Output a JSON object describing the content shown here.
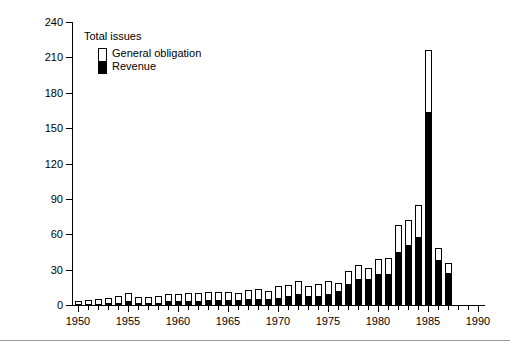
{
  "figure": {
    "ylabel": "Billions of Dollars",
    "legend": {
      "title": "Total issues",
      "items": [
        {
          "label": "General obligation",
          "color": "#ffffff"
        },
        {
          "label": "Revenue",
          "color": "#000000"
        }
      ]
    }
  },
  "chart_data": {
    "type": "bar",
    "subtype": "stacked-vertical",
    "title": "",
    "xlabel": "",
    "ylabel": "Billions of Dollars",
    "xlim": [
      1949.4,
      1990.6
    ],
    "ylim": [
      0,
      240
    ],
    "yticks": [
      0,
      30,
      60,
      90,
      120,
      150,
      180,
      210,
      240
    ],
    "xticks": [
      1950,
      1955,
      1960,
      1965,
      1970,
      1975,
      1980,
      1985,
      1990
    ],
    "xtick_labels": [
      "1950",
      "1955",
      "1960",
      "1965",
      "1970",
      "1975",
      "1980",
      "1985",
      "1990"
    ],
    "minor_xticks": [
      1951,
      1952,
      1953,
      1954,
      1956,
      1957,
      1958,
      1959,
      1961,
      1962,
      1963,
      1964,
      1966,
      1967,
      1968,
      1969,
      1971,
      1972,
      1973,
      1974,
      1976,
      1977,
      1978,
      1979,
      1981,
      1982,
      1983,
      1984,
      1986,
      1987,
      1988,
      1989
    ],
    "grid": false,
    "legend_position": "upper left",
    "x": [
      1950,
      1951,
      1952,
      1953,
      1954,
      1955,
      1956,
      1957,
      1958,
      1959,
      1960,
      1961,
      1962,
      1963,
      1964,
      1965,
      1966,
      1967,
      1968,
      1969,
      1970,
      1971,
      1972,
      1973,
      1974,
      1975,
      1976,
      1977,
      1978,
      1979,
      1980,
      1981,
      1982,
      1983,
      1984,
      1985,
      1986,
      1987
    ],
    "categories": [
      "1950",
      "1951",
      "1952",
      "1953",
      "1954",
      "1955",
      "1956",
      "1957",
      "1958",
      "1959",
      "1960",
      "1961",
      "1962",
      "1963",
      "1964",
      "1965",
      "1966",
      "1967",
      "1968",
      "1969",
      "1970",
      "1971",
      "1972",
      "1973",
      "1974",
      "1975",
      "1976",
      "1977",
      "1978",
      "1979",
      "1980",
      "1981",
      "1982",
      "1983",
      "1984",
      "1985",
      "1986",
      "1987"
    ],
    "series": [
      {
        "name": "Revenue",
        "color": "#000000",
        "values": [
          1,
          1,
          1,
          2,
          2,
          3,
          2,
          2,
          2,
          3,
          3,
          3,
          3,
          4,
          4,
          4,
          4,
          5,
          5,
          5,
          6,
          8,
          9,
          8,
          8,
          9,
          12,
          18,
          22,
          22,
          26,
          26,
          45,
          51,
          58,
          164,
          38,
          27
        ]
      },
      {
        "name": "General obligation",
        "color": "#ffffff",
        "values": [
          2,
          3,
          4,
          4,
          6,
          7,
          5,
          5,
          6,
          6,
          6,
          7,
          7,
          7,
          7,
          7,
          6,
          8,
          9,
          7,
          10,
          9,
          11,
          8,
          10,
          11,
          7,
          11,
          12,
          9,
          13,
          14,
          23,
          21,
          27,
          52,
          10,
          9
        ]
      }
    ],
    "totals": [
      3,
      4,
      5,
      6,
      8,
      10,
      7,
      7,
      8,
      9,
      9,
      10,
      10,
      11,
      11,
      11,
      10,
      13,
      14,
      12,
      16,
      17,
      20,
      16,
      18,
      20,
      19,
      29,
      34,
      31,
      39,
      40,
      68,
      72,
      85,
      216,
      48,
      36
    ]
  }
}
